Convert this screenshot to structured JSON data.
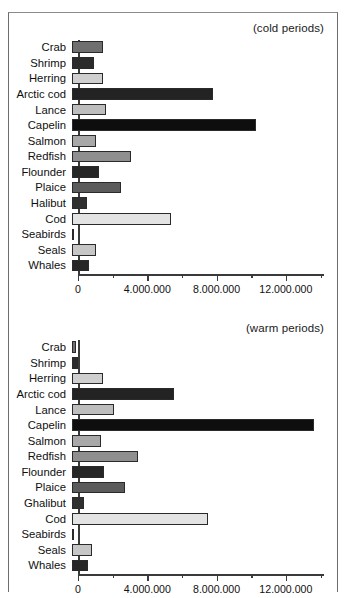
{
  "figure": {
    "background": "#ffffff",
    "bar_border_color": "#2a2a2a",
    "axis_color": "#3a3a3a"
  },
  "chart_data": [
    {
      "type": "bar",
      "orientation": "horizontal",
      "title": "(cold periods)",
      "xlabel": "",
      "ylabel": "",
      "xlim": [
        0,
        14200000
      ],
      "grid": false,
      "legend": "none",
      "tick_values": [
        0,
        4000000,
        8000000,
        12000000
      ],
      "tick_labels": [
        "0",
        "4.000.000",
        "8.000.000",
        "12.000.000"
      ],
      "minor_tick_values": [
        2000000,
        6000000,
        10000000,
        14000000
      ],
      "categories": [
        "Crab",
        "Shrimp",
        "Herring",
        "Arctic cod",
        "Lance",
        "Capelin",
        "Salmon",
        "Redfish",
        "Flounder",
        "Plaice",
        "Halibut",
        "Cod",
        "Seabirds",
        "Seals",
        "Whales"
      ],
      "values": [
        1790000,
        1270000,
        1790000,
        8150000,
        1960000,
        10630000,
        1390000,
        3410000,
        1560000,
        2830000,
        870000,
        5720000,
        60000,
        1390000,
        980000
      ],
      "colors": [
        "#6f6f6f",
        "#2b2b2b",
        "#cfcfcf",
        "#232323",
        "#bdbdbd",
        "#0e0e0e",
        "#a8a8a8",
        "#8f8f8f",
        "#262626",
        "#5b5b5b",
        "#2f2f2f",
        "#e3e3e3",
        "#f2f2f2",
        "#c6c6c6",
        "#262626"
      ]
    },
    {
      "type": "bar",
      "orientation": "horizontal",
      "title": "(warm periods)",
      "xlabel": "",
      "ylabel": "",
      "xlim": [
        0,
        14200000
      ],
      "grid": false,
      "legend": "none",
      "tick_values": [
        0,
        4000000,
        8000000,
        12000000
      ],
      "tick_labels": [
        "0",
        "4.000.000",
        "8.000.000",
        "12.000.000"
      ],
      "minor_tick_values": [
        2000000,
        6000000,
        10000000,
        14000000
      ],
      "categories": [
        "Crab",
        "Shrimp",
        "Herring",
        "Arctic cod",
        "Lance",
        "Capelin",
        "Salmon",
        "Redfish",
        "Flounder",
        "Plaice",
        "Ghalibut",
        "Cod",
        "Seabirds",
        "Seals",
        "Whales"
      ],
      "values": [
        230000,
        350000,
        1790000,
        5900000,
        2430000,
        13990000,
        1670000,
        3820000,
        1850000,
        3060000,
        690000,
        7860000,
        60000,
        1160000,
        930000
      ],
      "colors": [
        "#6f6f6f",
        "#2b2b2b",
        "#cfcfcf",
        "#232323",
        "#bdbdbd",
        "#0e0e0e",
        "#a8a8a8",
        "#8f8f8f",
        "#262626",
        "#5b5b5b",
        "#2f2f2f",
        "#e3e3e3",
        "#f2f2f2",
        "#c6c6c6",
        "#262626"
      ]
    }
  ]
}
